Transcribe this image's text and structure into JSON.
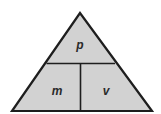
{
  "diagram": {
    "type": "formula-triangle",
    "colors": {
      "fill": "#d2d2d2",
      "stroke": "#1e1e1e",
      "background": "#ffffff"
    },
    "top": {
      "label": "p"
    },
    "bottom_left": {
      "label": "m"
    },
    "bottom_right": {
      "label": "v"
    }
  }
}
